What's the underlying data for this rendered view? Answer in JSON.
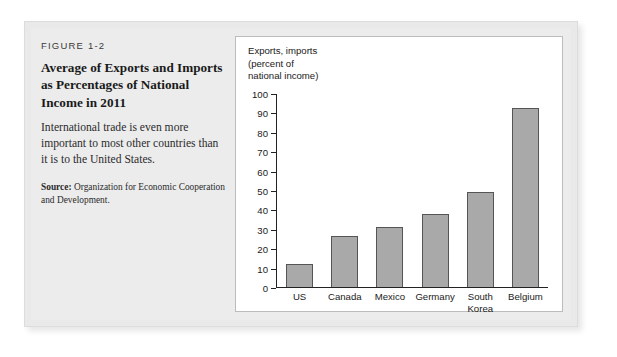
{
  "figure": {
    "number": "FIGURE 1-2",
    "title": "Average of Exports and Imports as Percentages of National Income in 2011",
    "description": "International trade is even more important to most other countries than it is to the United States.",
    "source_label": "Source:",
    "source_text": " Organization for Economic Cooperation and Development."
  },
  "chart_data": {
    "type": "bar",
    "title": "",
    "axis_title": "Exports, imports\n(percent of\nnational income)",
    "xlabel": "",
    "ylabel": "Exports, imports (percent of national income)",
    "categories": [
      "US",
      "Canada",
      "Mexico",
      "Germany",
      "South\nKorea",
      "Belgium"
    ],
    "values": [
      12,
      26.5,
      31,
      38,
      49,
      92.5
    ],
    "ylim": [
      0,
      100
    ],
    "yticks": [
      0,
      10,
      20,
      30,
      40,
      50,
      60,
      70,
      80,
      90,
      100
    ],
    "ytick_labels": [
      "0",
      "10",
      "20",
      "30",
      "40",
      "50",
      "60",
      "70",
      "80",
      "90",
      "100"
    ],
    "grid": false,
    "legend": false,
    "bar_color": "#a9a9a9",
    "bar_edge_color": "#555555"
  },
  "colors": {
    "frame_background": "#ececec",
    "card_background": "#ffffff",
    "axis": "#222222",
    "text": "#1a1a1a"
  }
}
